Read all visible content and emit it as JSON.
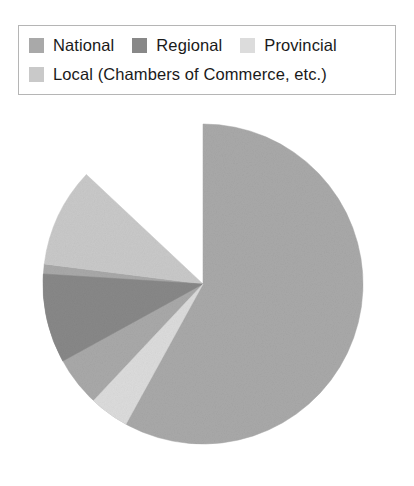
{
  "chart_data": {
    "type": "pie",
    "title": "",
    "subtitle": "",
    "xlabel": "",
    "ylabel": "",
    "grid": false,
    "legend_position": "top",
    "start_angle_deg": 90,
    "direction": "clockwise",
    "categories": [
      "National",
      "Regional",
      "Provincial",
      "Local (Chambers of Commerce, etc.)"
    ],
    "values": [
      77,
      9,
      4,
      10
    ],
    "units": "percent",
    "colors": [
      "#a9a9a9",
      "#888888",
      "#dcdcdc",
      "#c9c9c9"
    ],
    "slices": [
      {
        "label": "National",
        "value": 77,
        "color": "#a9a9a9",
        "start_deg": 90,
        "sweep_deg": 277.2
      },
      {
        "label": "Local (Chambers of Commerce, etc.)",
        "value": 10,
        "color": "#c9c9c9",
        "start_deg": 172.8,
        "sweep_deg": 36.0
      },
      {
        "label": "Regional",
        "value": 9,
        "color": "#888888",
        "start_deg": 208.8,
        "sweep_deg": 32.4
      },
      {
        "label": "Provincial",
        "value": 4,
        "color": "#dcdcdc",
        "start_deg": 241.2,
        "sweep_deg": 14.4
      }
    ],
    "geometry": {
      "center_x": 203,
      "center_y": 284,
      "radius": 160
    }
  },
  "legend": {
    "rows": [
      {
        "entries": [
          {
            "label": "National",
            "color": "#a9a9a9",
            "swatch_name": "legend-swatch-national"
          },
          {
            "label": "Regional",
            "color": "#888888",
            "swatch_name": "legend-swatch-regional"
          },
          {
            "label": "Provincial",
            "color": "#dcdcdc",
            "swatch_name": "legend-swatch-provincial"
          }
        ]
      },
      {
        "entries": [
          {
            "label": "Local (Chambers of Commerce, etc.)",
            "color": "#c9c9c9",
            "swatch_name": "legend-swatch-local"
          }
        ]
      }
    ]
  },
  "style": {
    "background": "#ffffff",
    "legend_border": "#b5b5b5",
    "text_color": "#1a1a1a"
  }
}
